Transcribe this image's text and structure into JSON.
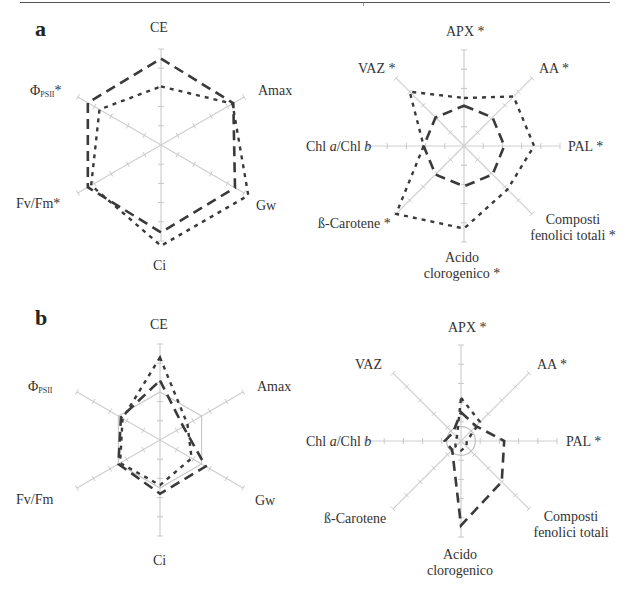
{
  "panels": {
    "a": {
      "letter": "a"
    },
    "b": {
      "letter": "b"
    }
  },
  "labels": {
    "a_left": {
      "ce": "CE",
      "amax": "Amax",
      "gw": "Gw",
      "ci": "Ci",
      "fvfm": "Fv/Fm*",
      "phi": "Φ",
      "phi_sub": "PSII",
      "phi_suffix": "*"
    },
    "a_right": {
      "apx": "APX *",
      "aa": "AA *",
      "pal": "PAL *",
      "composti_1": "Composti",
      "composti_2": "fenolici totali *",
      "acido_1": "Acido",
      "acido_2": "clorogenico *",
      "carotene": "ß-Carotene *",
      "chl": "Chl a/Chl b",
      "vaz": "VAZ *"
    },
    "b_left": {
      "ce": "CE",
      "amax": "Amax",
      "gw": "Gw",
      "ci": "Ci",
      "fvfm": "Fv/Fm",
      "phi": "Φ",
      "phi_sub": "PSII",
      "phi_suffix": ""
    },
    "b_right": {
      "apx": "APX *",
      "aa": "AA *",
      "pal": "PAL *",
      "composti_1": "Composti",
      "composti_2": "fenolici totali",
      "acido_1": "Acido",
      "acido_2": "clorogenico",
      "carotene": "ß-Carotene",
      "chl": "Chl a/Chl b",
      "vaz": "VAZ"
    }
  },
  "chart_data": [
    {
      "type": "radar",
      "panel": "a",
      "title": "a (left) - photosynthetic parameters",
      "axes": [
        "CE",
        "Amax",
        "Gw",
        "Ci",
        "Fv/Fm*",
        "ΦPSII*"
      ],
      "range": [
        0,
        1
      ],
      "ticks_per_axis": 5,
      "grid": "axes only",
      "series": [
        {
          "name": "dashed",
          "style": "long-dash",
          "values": [
            0.9,
            0.87,
            0.89,
            0.91,
            0.88,
            0.88
          ]
        },
        {
          "name": "dotted",
          "style": "short-dash",
          "values": [
            0.61,
            0.86,
            1.05,
            1.05,
            0.84,
            0.74
          ]
        }
      ]
    },
    {
      "type": "radar",
      "panel": "a",
      "title": "a (right) - biochemical parameters",
      "axes": [
        "APX *",
        "AA *",
        "PAL *",
        "Composti fenolici totali *",
        "Acido clorogenico *",
        "ß-Carotene *",
        "Chl a/Chl b",
        "VAZ *"
      ],
      "range": [
        0,
        1
      ],
      "ticks_per_axis": 5,
      "series": [
        {
          "name": "dashed",
          "style": "long-dash",
          "values": [
            0.42,
            0.42,
            0.42,
            0.42,
            0.42,
            0.42,
            0.42,
            0.42
          ]
        },
        {
          "name": "dotted",
          "style": "short-dash",
          "values": [
            0.5,
            0.73,
            0.73,
            0.64,
            0.86,
            1.0,
            0.42,
            0.8
          ]
        }
      ]
    },
    {
      "type": "radar",
      "panel": "b",
      "title": "b (left) - photosynthetic parameters",
      "axes": [
        "CE",
        "Amax",
        "Gw",
        "Ci",
        "Fv/Fm",
        "ΦPSII"
      ],
      "range": [
        0,
        1
      ],
      "reference_polygon": 0.5,
      "series": [
        {
          "name": "dashed",
          "style": "long-dash",
          "values": [
            0.62,
            0.28,
            0.55,
            0.56,
            0.5,
            0.47
          ]
        },
        {
          "name": "dotted",
          "style": "short-dash",
          "values": [
            0.86,
            0.33,
            0.38,
            0.47,
            0.48,
            0.45
          ]
        }
      ]
    },
    {
      "type": "radar",
      "panel": "b",
      "title": "b (right) - biochemical parameters",
      "axes": [
        "APX *",
        "AA *",
        "PAL *",
        "Composti fenolici totali",
        "Acido clorogenico",
        "ß-Carotene",
        "Chl a/Chl b",
        "VAZ"
      ],
      "range": [
        0,
        1
      ],
      "reference_circle": 0.15,
      "series": [
        {
          "name": "dashed",
          "style": "long-dash",
          "values": [
            0.3,
            0.22,
            0.45,
            0.6,
            0.88,
            0.13,
            0.17,
            0.12
          ]
        },
        {
          "name": "dotted",
          "style": "short-dash",
          "values": [
            0.45,
            0.28,
            0.06,
            0.08,
            0.1,
            0.08,
            0.06,
            0.06
          ]
        }
      ]
    }
  ]
}
